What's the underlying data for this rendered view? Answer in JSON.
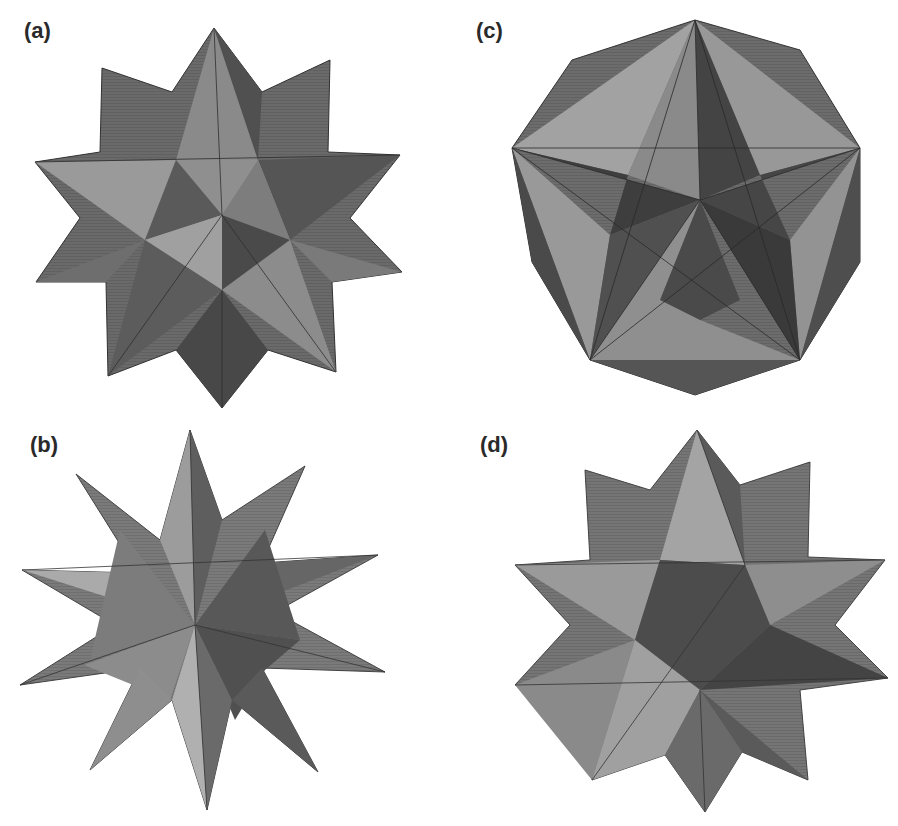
{
  "figure": {
    "panels": [
      {
        "id": "a",
        "label": "(a)",
        "subject": "small stellated dodecahedron (12-pointed star polyhedron)",
        "colors": {
          "dark": "#4a4a4a",
          "mid": "#6e6e6e",
          "light": "#9a9a9a"
        }
      },
      {
        "id": "b",
        "label": "(b)",
        "subject": "great stellated dodecahedron (long-spiked star polyhedron)",
        "colors": {
          "dark": "#555555",
          "mid": "#7a7a7a",
          "light": "#a8a8a8"
        }
      },
      {
        "id": "c",
        "label": "(c)",
        "subject": "great dodecahedron (decagonal outline with inset pentagram)",
        "colors": {
          "dark": "#3e3e3e",
          "mid": "#6a6a6a",
          "light": "#9c9c9c"
        }
      },
      {
        "id": "d",
        "label": "(d)",
        "subject": "great icosahedron / stellated form (12-pointed star polyhedron)",
        "colors": {
          "dark": "#4c4c4c",
          "mid": "#727272",
          "light": "#a0a0a0"
        }
      }
    ]
  }
}
